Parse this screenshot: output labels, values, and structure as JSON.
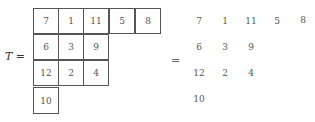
{
  "lhs": {
    "symbol": "T",
    "equals": "="
  },
  "middle_equals": "=",
  "tableau": {
    "rows": [
      [
        "7",
        "1",
        "11",
        "5",
        "8"
      ],
      [
        "6",
        "3",
        "9"
      ],
      [
        "12",
        "2",
        "4"
      ],
      [
        "10"
      ]
    ]
  }
}
